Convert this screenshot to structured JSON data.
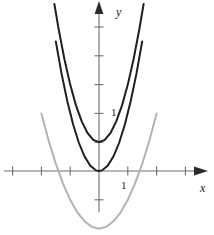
{
  "figure": {
    "width": 214,
    "height": 235,
    "background": "#ffffff",
    "origin": {
      "x": 99,
      "y": 171
    },
    "unit_px": 28.8
  },
  "axes": {
    "x_axis": {
      "label": "x",
      "color": "#6e6e6e",
      "arrow": "right",
      "tick_positions": [
        -3,
        -2,
        -1,
        1,
        2,
        3
      ],
      "tick_label": "1",
      "tick_label_value": 1
    },
    "y_axis": {
      "label": "y",
      "color": "#6e6e6e",
      "arrow": "up",
      "tick_positions": [
        -1,
        1,
        2,
        3,
        4
      ],
      "tick_label": "1",
      "tick_label_value": 1
    }
  },
  "chart_data": {
    "type": "line",
    "title": "",
    "xlabel": "x",
    "ylabel": "y",
    "xlim": [
      -3.45,
      3.45
    ],
    "ylim": [
      -2.2,
      5.0
    ],
    "grid": false,
    "legend": "none",
    "tick_labels": {
      "x": [
        "1"
      ],
      "y": [
        "1"
      ]
    },
    "series": [
      {
        "name": "outer-dark-parabola",
        "equation": "y = 2x^2 + 1",
        "color": "#1f1f1f",
        "linewidth": 2.0,
        "vertex": [
          0,
          1
        ],
        "x": [
          -1.55,
          -1.4,
          -1.2,
          -1.0,
          -0.8,
          -0.6,
          -0.4,
          -0.2,
          0,
          0.2,
          0.4,
          0.6,
          0.8,
          1.0,
          1.2,
          1.4,
          1.55
        ],
        "values": [
          5.8,
          4.92,
          3.88,
          3.0,
          2.28,
          1.72,
          1.32,
          1.08,
          1.0,
          1.08,
          1.32,
          1.72,
          2.28,
          3.0,
          3.88,
          4.92,
          5.8
        ]
      },
      {
        "name": "inner-dark-parabola",
        "equation": "y = 2x^2",
        "color": "#1f1f1f",
        "linewidth": 2.0,
        "vertex": [
          0,
          0
        ],
        "x": [
          -1.5,
          -1.3,
          -1.1,
          -0.9,
          -0.7,
          -0.5,
          -0.3,
          -0.1,
          0,
          0.1,
          0.3,
          0.5,
          0.7,
          0.9,
          1.1,
          1.3,
          1.5
        ],
        "values": [
          4.5,
          3.38,
          2.42,
          1.62,
          0.98,
          0.5,
          0.18,
          0.02,
          0,
          0.02,
          0.18,
          0.5,
          0.98,
          1.62,
          2.42,
          3.38,
          4.5
        ]
      },
      {
        "name": "gray-parabola",
        "equation": "y = x^2 - 2",
        "color": "#b3b3b3",
        "linewidth": 2.0,
        "vertex": [
          0,
          -2
        ],
        "roots": [
          -1.41,
          1.41
        ],
        "x": [
          -2.0,
          -1.75,
          -1.5,
          -1.25,
          -1.0,
          -0.75,
          -0.5,
          -0.25,
          0,
          0.25,
          0.5,
          0.75,
          1.0,
          1.25,
          1.5,
          1.75,
          2.0
        ],
        "values": [
          2.0,
          1.06,
          0.25,
          -0.44,
          -1.0,
          -1.44,
          -1.75,
          -1.94,
          -2.0,
          -1.94,
          -1.75,
          -1.44,
          -1.0,
          -0.44,
          0.25,
          1.06,
          2.0
        ]
      }
    ]
  }
}
